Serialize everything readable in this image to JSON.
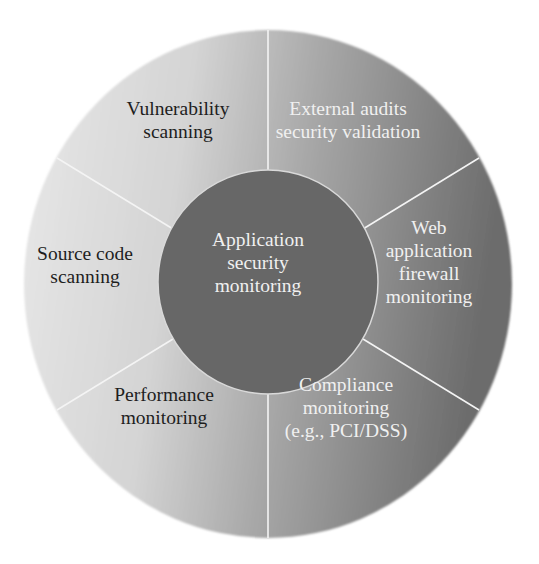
{
  "diagram": {
    "type": "wheel",
    "center": {
      "label_lines": [
        "Application",
        "security",
        "monitoring"
      ],
      "fill": "#676767",
      "text_color": "#f0f0f0"
    },
    "segments": [
      {
        "id": "vulnerability-scanning",
        "label_lines": [
          "Vulnerability",
          "scanning"
        ],
        "text_color": "#1e1e1e"
      },
      {
        "id": "external-audits",
        "label_lines": [
          "External audits",
          "security validation"
        ],
        "text_color": "#f0f0f0"
      },
      {
        "id": "waf-monitoring",
        "label_lines": [
          "Web",
          "application",
          "firewall",
          "monitoring"
        ],
        "text_color": "#f0f0f0"
      },
      {
        "id": "compliance-monitoring",
        "label_lines": [
          "Compliance",
          "monitoring",
          "(e.g., PCI/DSS)"
        ],
        "text_color": "#f0f0f0"
      },
      {
        "id": "performance-monitoring",
        "label_lines": [
          "Performance",
          "monitoring"
        ],
        "text_color": "#1e1e1e"
      },
      {
        "id": "source-code-scanning",
        "label_lines": [
          "Source code",
          "scanning"
        ],
        "text_color": "#1e1e1e"
      }
    ],
    "colors": {
      "ring_light": "#e6e6e6",
      "ring_dark": "#6f6f6f",
      "divider": "#f4f4f4"
    }
  }
}
